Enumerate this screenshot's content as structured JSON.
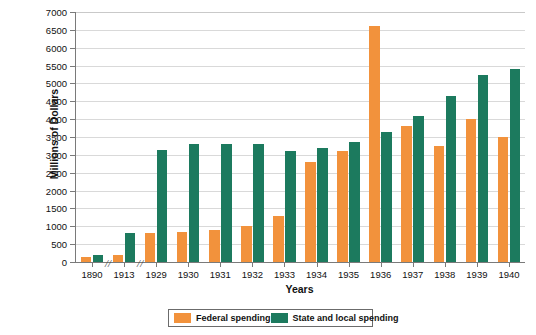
{
  "chart_data": {
    "type": "bar",
    "title": "",
    "xlabel": "Years",
    "ylabel": "Millions of Dollars",
    "ylim": [
      0,
      7000
    ],
    "ytick_step": 500,
    "yticks": [
      0,
      500,
      1000,
      1500,
      2000,
      2500,
      3000,
      3500,
      4000,
      4500,
      5000,
      5500,
      6000,
      6500,
      7000
    ],
    "grid": true,
    "legend_position": "bottom",
    "axis_breaks_after": [
      "1890",
      "1913"
    ],
    "categories": [
      "1890",
      "1913",
      "1929",
      "1930",
      "1931",
      "1932",
      "1933",
      "1934",
      "1935",
      "1936",
      "1937",
      "1938",
      "1939",
      "1940"
    ],
    "series": [
      {
        "name": "Federal spending",
        "color": "#F2923C",
        "values": [
          130,
          190,
          800,
          850,
          900,
          1000,
          1300,
          2800,
          3100,
          6600,
          3800,
          3250,
          4000,
          3500
        ]
      },
      {
        "name": "State and local spending",
        "color": "#1C7A5E",
        "values": [
          190,
          800,
          3150,
          3300,
          3300,
          3300,
          3100,
          3200,
          3350,
          3650,
          4100,
          4650,
          5250,
          5400
        ]
      }
    ]
  },
  "legend": {
    "items": [
      {
        "label": "Federal spending",
        "color": "#F2923C"
      },
      {
        "label": "State and local spending",
        "color": "#1C7A5E"
      }
    ]
  },
  "axis": {
    "y_title": "Millions of Dollars",
    "x_title": "Years",
    "break_glyph": "//"
  }
}
